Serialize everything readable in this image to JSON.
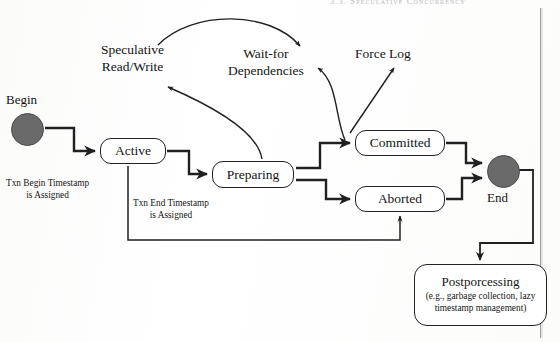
{
  "page": {
    "running_header": "3.3. Speculative Concurrency",
    "background_color": "#fdfdfc",
    "ink_color": "#1c1c1c",
    "node_fill_color": "#6a6a6a"
  },
  "diagram": {
    "type": "state-transition-diagram",
    "terminals": [
      {
        "id": "begin",
        "label": "Begin",
        "shape": "filled-circle"
      },
      {
        "id": "end",
        "label": "End",
        "shape": "filled-circle"
      }
    ],
    "states": [
      {
        "id": "active",
        "label": "Active"
      },
      {
        "id": "preparing",
        "label": "Preparing"
      },
      {
        "id": "committed",
        "label": "Committed"
      },
      {
        "id": "aborted",
        "label": "Aborted"
      },
      {
        "id": "postprocessing",
        "label": "Postporcessing",
        "sublabel_line1": "(e.g., garbage collection, lazy",
        "sublabel_line2": "timestamp management)"
      }
    ],
    "annotations": [
      {
        "id": "speculative",
        "line1": "Speculative",
        "line2": "Read/Write"
      },
      {
        "id": "wait-for",
        "line1": "Wait-for",
        "line2": "Dependencies"
      },
      {
        "id": "force-log",
        "line1": "Force Log",
        "line2": ""
      },
      {
        "id": "begin-timestamp",
        "line1": "Txn Begin Timestamp",
        "line2": "is Assigned"
      },
      {
        "id": "end-timestamp",
        "line1": "Txn End Timestamp",
        "line2": "is Assigned"
      }
    ],
    "transitions": [
      {
        "from": "begin",
        "to": "active",
        "label": "Txn Begin Timestamp is Assigned"
      },
      {
        "from": "active",
        "to": "preparing",
        "label": "Txn End Timestamp is Assigned"
      },
      {
        "from": "preparing",
        "to": "committed",
        "label": ""
      },
      {
        "from": "preparing",
        "to": "aborted",
        "label": ""
      },
      {
        "from": "preparing",
        "to": "speculative-read-write",
        "label": "Speculative Read/Write"
      },
      {
        "from": "speculative-read-write",
        "to": "wait-for-dependencies",
        "label": "Wait-for Dependencies"
      },
      {
        "from": "committed",
        "to": "wait-for-dependencies",
        "label": ""
      },
      {
        "from": "committed",
        "to": "force-log",
        "label": "Force Log"
      },
      {
        "from": "committed",
        "to": "end",
        "label": ""
      },
      {
        "from": "aborted",
        "to": "end",
        "label": ""
      },
      {
        "from": "active",
        "to": "aborted",
        "label": ""
      },
      {
        "from": "end",
        "to": "postprocessing",
        "label": ""
      }
    ]
  }
}
